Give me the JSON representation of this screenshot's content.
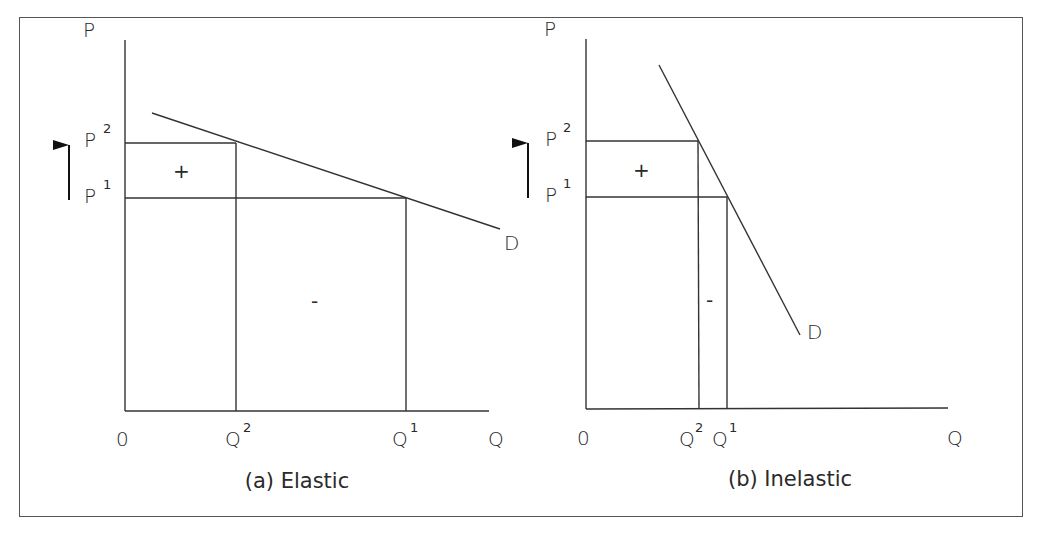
{
  "figure": {
    "panels": [
      {
        "id": "a",
        "caption": "(a) Elastic",
        "y_axis_label": "P",
        "x_axis_label": "Q",
        "origin_label": "0",
        "price_labels": {
          "p2": "P",
          "p2_sup": "2",
          "p1": "P",
          "p1_sup": "1"
        },
        "quantity_labels": {
          "q2": "Q",
          "q2_sup": "2",
          "q1": "Q",
          "q1_sup": "1"
        },
        "curve_label": "D",
        "gain_sign": "+",
        "loss_sign": "-",
        "arrow": "up-arrow-icon"
      },
      {
        "id": "b",
        "caption": "(b) Inelastic",
        "y_axis_label": "P",
        "x_axis_label": "Q",
        "origin_label": "0",
        "price_labels": {
          "p2": "P",
          "p2_sup": "2",
          "p1": "P",
          "p1_sup": "1"
        },
        "quantity_labels": {
          "q2": "Q",
          "q2_sup": "2",
          "q1": "Q",
          "q1_sup": "1"
        },
        "curve_label": "D",
        "gain_sign": "+",
        "loss_sign": "-",
        "arrow": "up-arrow-icon"
      }
    ],
    "colors": {
      "line": "#333333",
      "text": "#2a2a2a",
      "frame": "#555555",
      "background": "#ffffff"
    }
  }
}
